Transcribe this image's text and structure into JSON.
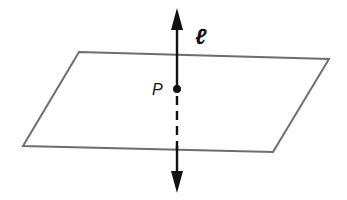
{
  "diagram": {
    "line_label": "ℓ",
    "point_label": "P",
    "colors": {
      "plane_stroke": "#6e6e6e",
      "line": "#111111"
    }
  }
}
